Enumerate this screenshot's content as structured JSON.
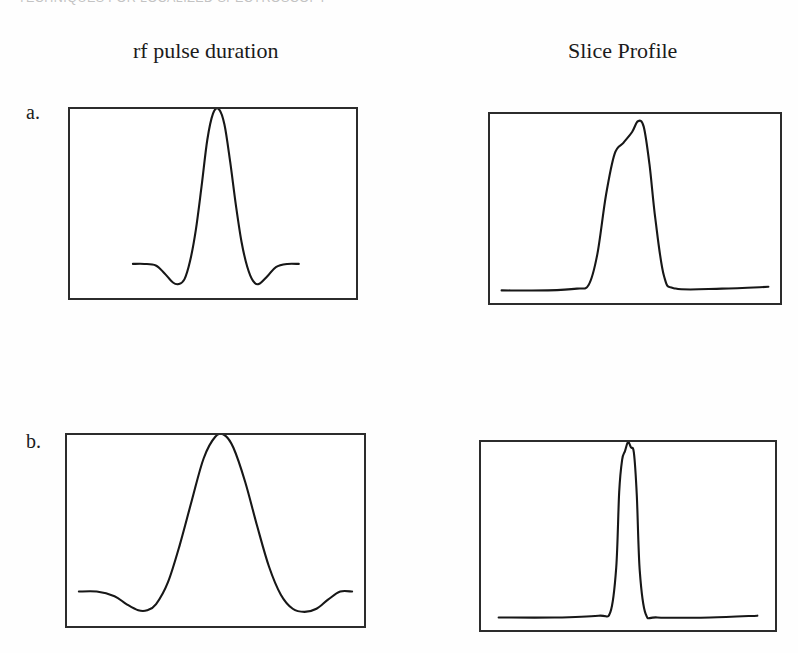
{
  "page": {
    "running_header": "TECHNIQUES FOR LOCALIZED SPECTROSCOPY",
    "background_color": "#ffffff",
    "ink_color": "#171717"
  },
  "columns": {
    "left_title": "rf  pulse duration",
    "right_title": "Slice Profile"
  },
  "panels": [
    {
      "letter": "a.",
      "pulse_caption": "rf  pulse duration",
      "profile_caption": "Slice Profile"
    },
    {
      "letter": "b.",
      "pulse_caption": "rf  pulse duration",
      "profile_caption": "Slice Profile"
    }
  ],
  "chart_data": [
    {
      "id": "a-pulse",
      "type": "line",
      "title": "rf  pulse duration",
      "panel": "a.",
      "xlabel": "",
      "ylabel": "",
      "grid": false,
      "legend": "none",
      "xlim": [
        0,
        100
      ],
      "ylim": [
        -0.22,
        1.0
      ],
      "description": "Short-duration sinc rf pulse: narrow tall central lobe with shallow negative side lobes and flat tails.",
      "x": [
        22,
        26,
        30,
        33,
        36,
        38,
        40,
        42,
        44,
        46,
        48,
        50,
        52,
        54,
        56,
        58,
        60,
        62,
        64,
        66,
        69,
        72,
        76,
        80
      ],
      "y": [
        0.0,
        0.0,
        -0.01,
        -0.06,
        -0.12,
        -0.13,
        -0.1,
        0.02,
        0.22,
        0.5,
        0.8,
        0.97,
        1.0,
        0.9,
        0.66,
        0.38,
        0.14,
        -0.02,
        -0.11,
        -0.13,
        -0.08,
        -0.02,
        0.0,
        0.0
      ]
    },
    {
      "id": "a-profile",
      "type": "line",
      "title": "Slice Profile",
      "panel": "a.",
      "xlabel": "",
      "ylabel": "",
      "grid": false,
      "legend": "none",
      "xlim": [
        0,
        100
      ],
      "ylim": [
        -0.05,
        1.0
      ],
      "description": "Slice profile for the short sinc pulse: moderately wide trapezoidal slab with sloped edges and a slightly rounded top.",
      "x": [
        4,
        20,
        30,
        34,
        37,
        40,
        43,
        46,
        49,
        51,
        53,
        55,
        57,
        60,
        64,
        80,
        96
      ],
      "y": [
        0.02,
        0.02,
        0.03,
        0.05,
        0.22,
        0.55,
        0.78,
        0.84,
        0.9,
        0.96,
        0.93,
        0.72,
        0.42,
        0.1,
        0.03,
        0.03,
        0.04
      ]
    },
    {
      "id": "b-pulse",
      "type": "line",
      "title": "rf  pulse duration",
      "panel": "b.",
      "xlabel": "",
      "ylabel": "",
      "grid": false,
      "legend": "none",
      "xlim": [
        0,
        100
      ],
      "ylim": [
        -0.22,
        1.0
      ],
      "description": "Long-duration sinc rf pulse: broad central lobe spanning much of the box with wide shallow negative side lobes.",
      "x": [
        4,
        10,
        16,
        20,
        24,
        27,
        30,
        34,
        38,
        42,
        46,
        50,
        53,
        56,
        60,
        64,
        68,
        72,
        76,
        80,
        84,
        88,
        92,
        96
      ],
      "y": [
        0.0,
        0.0,
        -0.03,
        -0.08,
        -0.12,
        -0.12,
        -0.08,
        0.06,
        0.3,
        0.58,
        0.85,
        0.99,
        1.0,
        0.92,
        0.7,
        0.42,
        0.16,
        -0.02,
        -0.11,
        -0.13,
        -0.11,
        -0.05,
        0.0,
        0.0
      ]
    },
    {
      "id": "b-profile",
      "type": "line",
      "title": "Slice Profile",
      "panel": "b.",
      "xlabel": "",
      "ylabel": "",
      "grid": false,
      "legend": "none",
      "xlim": [
        0,
        100
      ],
      "ylim": [
        -0.05,
        1.0
      ],
      "description": "Slice profile for the long sinc pulse: very narrow tall spike with steep edges on a flat baseline (thin slice).",
      "x": [
        6,
        25,
        40,
        44,
        46,
        47,
        48,
        49,
        50,
        51,
        52,
        53,
        54,
        56,
        60,
        78,
        94
      ],
      "y": [
        0.02,
        0.02,
        0.03,
        0.05,
        0.3,
        0.72,
        0.9,
        0.95,
        1.0,
        0.97,
        0.94,
        0.7,
        0.28,
        0.04,
        0.02,
        0.02,
        0.03
      ]
    }
  ]
}
